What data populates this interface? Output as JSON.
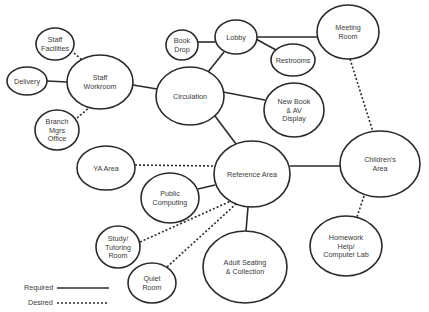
{
  "diagram": {
    "type": "adjacency-bubble-diagram",
    "nodes": [
      {
        "id": "staff-facilities",
        "lines": [
          "Staff",
          "Facilities"
        ],
        "cx": 55,
        "cy": 44,
        "rx": 19,
        "ry": 16
      },
      {
        "id": "delivery",
        "lines": [
          "Delivery"
        ],
        "cx": 27,
        "cy": 81,
        "rx": 20,
        "ry": 14
      },
      {
        "id": "staff-workroom",
        "lines": [
          "Staff",
          "Workroom"
        ],
        "cx": 100,
        "cy": 82,
        "rx": 33,
        "ry": 27
      },
      {
        "id": "branch-mgrs-office",
        "lines": [
          "Branch",
          "Mgrs",
          "Office"
        ],
        "cx": 57,
        "cy": 130,
        "rx": 22,
        "ry": 20
      },
      {
        "id": "book-drop",
        "lines": [
          "Book",
          "Drop"
        ],
        "cx": 182,
        "cy": 45,
        "rx": 16,
        "ry": 15
      },
      {
        "id": "lobby",
        "lines": [
          "Lobby"
        ],
        "cx": 236,
        "cy": 37,
        "rx": 21,
        "ry": 17
      },
      {
        "id": "restrooms",
        "lines": [
          "Restrooms"
        ],
        "cx": 293,
        "cy": 60,
        "rx": 22,
        "ry": 16
      },
      {
        "id": "meeting-room",
        "lines": [
          "Meeting",
          "Room"
        ],
        "cx": 348,
        "cy": 32,
        "rx": 31,
        "ry": 27
      },
      {
        "id": "circulation",
        "lines": [
          "Circulation"
        ],
        "cx": 190,
        "cy": 96,
        "rx": 34,
        "ry": 29
      },
      {
        "id": "new-book-av-display",
        "lines": [
          "New Book",
          "& AV",
          "Display"
        ],
        "cx": 294,
        "cy": 110,
        "rx": 30,
        "ry": 27
      },
      {
        "id": "ya-area",
        "lines": [
          "YA Area"
        ],
        "cx": 106,
        "cy": 168,
        "rx": 29,
        "ry": 22
      },
      {
        "id": "reference-area",
        "lines": [
          "Reference Area"
        ],
        "cx": 252,
        "cy": 174,
        "rx": 38,
        "ry": 33
      },
      {
        "id": "public-computing",
        "lines": [
          "Public",
          "Computing"
        ],
        "cx": 170,
        "cy": 198,
        "rx": 29,
        "ry": 25
      },
      {
        "id": "childrens-area",
        "lines": [
          "Children's",
          "Area"
        ],
        "cx": 380,
        "cy": 164,
        "rx": 40,
        "ry": 33
      },
      {
        "id": "study-tutoring-room",
        "lines": [
          "Study/",
          "Tutoring",
          "Room"
        ],
        "cx": 118,
        "cy": 247,
        "rx": 22,
        "ry": 21
      },
      {
        "id": "quiet-room",
        "lines": [
          "Quiet",
          "Room"
        ],
        "cx": 152,
        "cy": 283,
        "rx": 24,
        "ry": 20
      },
      {
        "id": "adult-seating-collection",
        "lines": [
          "Adult Seating",
          "& Collection"
        ],
        "cx": 245,
        "cy": 267,
        "rx": 42,
        "ry": 36
      },
      {
        "id": "homework-help-computer-lab",
        "lines": [
          "Homework",
          "Help/",
          "Computer Lab"
        ],
        "cx": 346,
        "cy": 246,
        "rx": 36,
        "ry": 30
      }
    ],
    "edges": [
      {
        "from": "delivery",
        "to": "staff-workroom",
        "type": "required",
        "x1": 47,
        "y1": 81,
        "x2": 67,
        "y2": 82
      },
      {
        "from": "staff-facilities",
        "to": "staff-workroom",
        "type": "desired",
        "x1": 74,
        "y1": 53,
        "x2": 82,
        "y2": 60
      },
      {
        "from": "branch-mgrs-office",
        "to": "staff-workroom",
        "type": "desired",
        "x1": 77,
        "y1": 118,
        "x2": 90,
        "y2": 107
      },
      {
        "from": "staff-workroom",
        "to": "circulation",
        "type": "required",
        "x1": 133,
        "y1": 85,
        "x2": 157,
        "y2": 89
      },
      {
        "from": "book-drop",
        "to": "lobby",
        "type": "required",
        "x1": 198,
        "y1": 42,
        "x2": 215,
        "y2": 42
      },
      {
        "from": "lobby",
        "to": "circulation",
        "type": "required",
        "x1": 224,
        "y1": 52,
        "x2": 208,
        "y2": 72
      },
      {
        "from": "lobby",
        "to": "restrooms",
        "type": "required",
        "x1": 256,
        "y1": 39,
        "x2": 276,
        "y2": 50
      },
      {
        "from": "lobby",
        "to": "meeting-room",
        "type": "required",
        "x1": 257,
        "y1": 37,
        "x2": 317,
        "y2": 37
      },
      {
        "from": "circulation",
        "to": "new-book-av-display",
        "type": "required",
        "x1": 223,
        "y1": 92,
        "x2": 265,
        "y2": 100
      },
      {
        "from": "circulation",
        "to": "reference-area",
        "type": "required",
        "x1": 215,
        "y1": 116,
        "x2": 236,
        "y2": 144
      },
      {
        "from": "meeting-room",
        "to": "childrens-area",
        "type": "desired",
        "x1": 350,
        "y1": 59,
        "x2": 373,
        "y2": 132
      },
      {
        "from": "ya-area",
        "to": "reference-area",
        "type": "desired",
        "x1": 135,
        "y1": 165,
        "x2": 214,
        "y2": 166
      },
      {
        "from": "public-computing",
        "to": "reference-area",
        "type": "required",
        "x1": 198,
        "y1": 189,
        "x2": 215,
        "y2": 185
      },
      {
        "from": "reference-area",
        "to": "childrens-area",
        "type": "required",
        "x1": 290,
        "y1": 166,
        "x2": 340,
        "y2": 166
      },
      {
        "from": "study-tutoring-room",
        "to": "reference-area",
        "type": "desired",
        "x1": 140,
        "y1": 242,
        "x2": 231,
        "y2": 201
      },
      {
        "from": "quiet-room",
        "to": "reference-area",
        "type": "desired",
        "x1": 167,
        "y1": 267,
        "x2": 236,
        "y2": 204
      },
      {
        "from": "reference-area",
        "to": "adult-seating-collection",
        "type": "required",
        "x1": 248,
        "y1": 207,
        "x2": 246,
        "y2": 231
      },
      {
        "from": "childrens-area",
        "to": "homework-help-computer-lab",
        "type": "desired",
        "x1": 364,
        "y1": 196,
        "x2": 357,
        "y2": 217
      }
    ]
  },
  "legend": {
    "required_label": "Required",
    "desired_label": "Desired"
  }
}
